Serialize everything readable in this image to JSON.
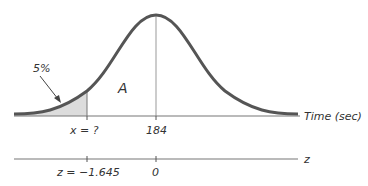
{
  "diagram": {
    "type": "normal-distribution",
    "labels": {
      "tail_percent": "5%",
      "area": "A",
      "x_axis_title": "Time (sec)",
      "z_axis_title": "z",
      "x_cutoff": "x = ?",
      "x_mean": "184",
      "z_cutoff": "z = −1.645",
      "z_mean": "0"
    },
    "colors": {
      "curve": "#555555",
      "shade": "#dcdcdc",
      "axis": "#777777",
      "text": "#333333"
    }
  }
}
